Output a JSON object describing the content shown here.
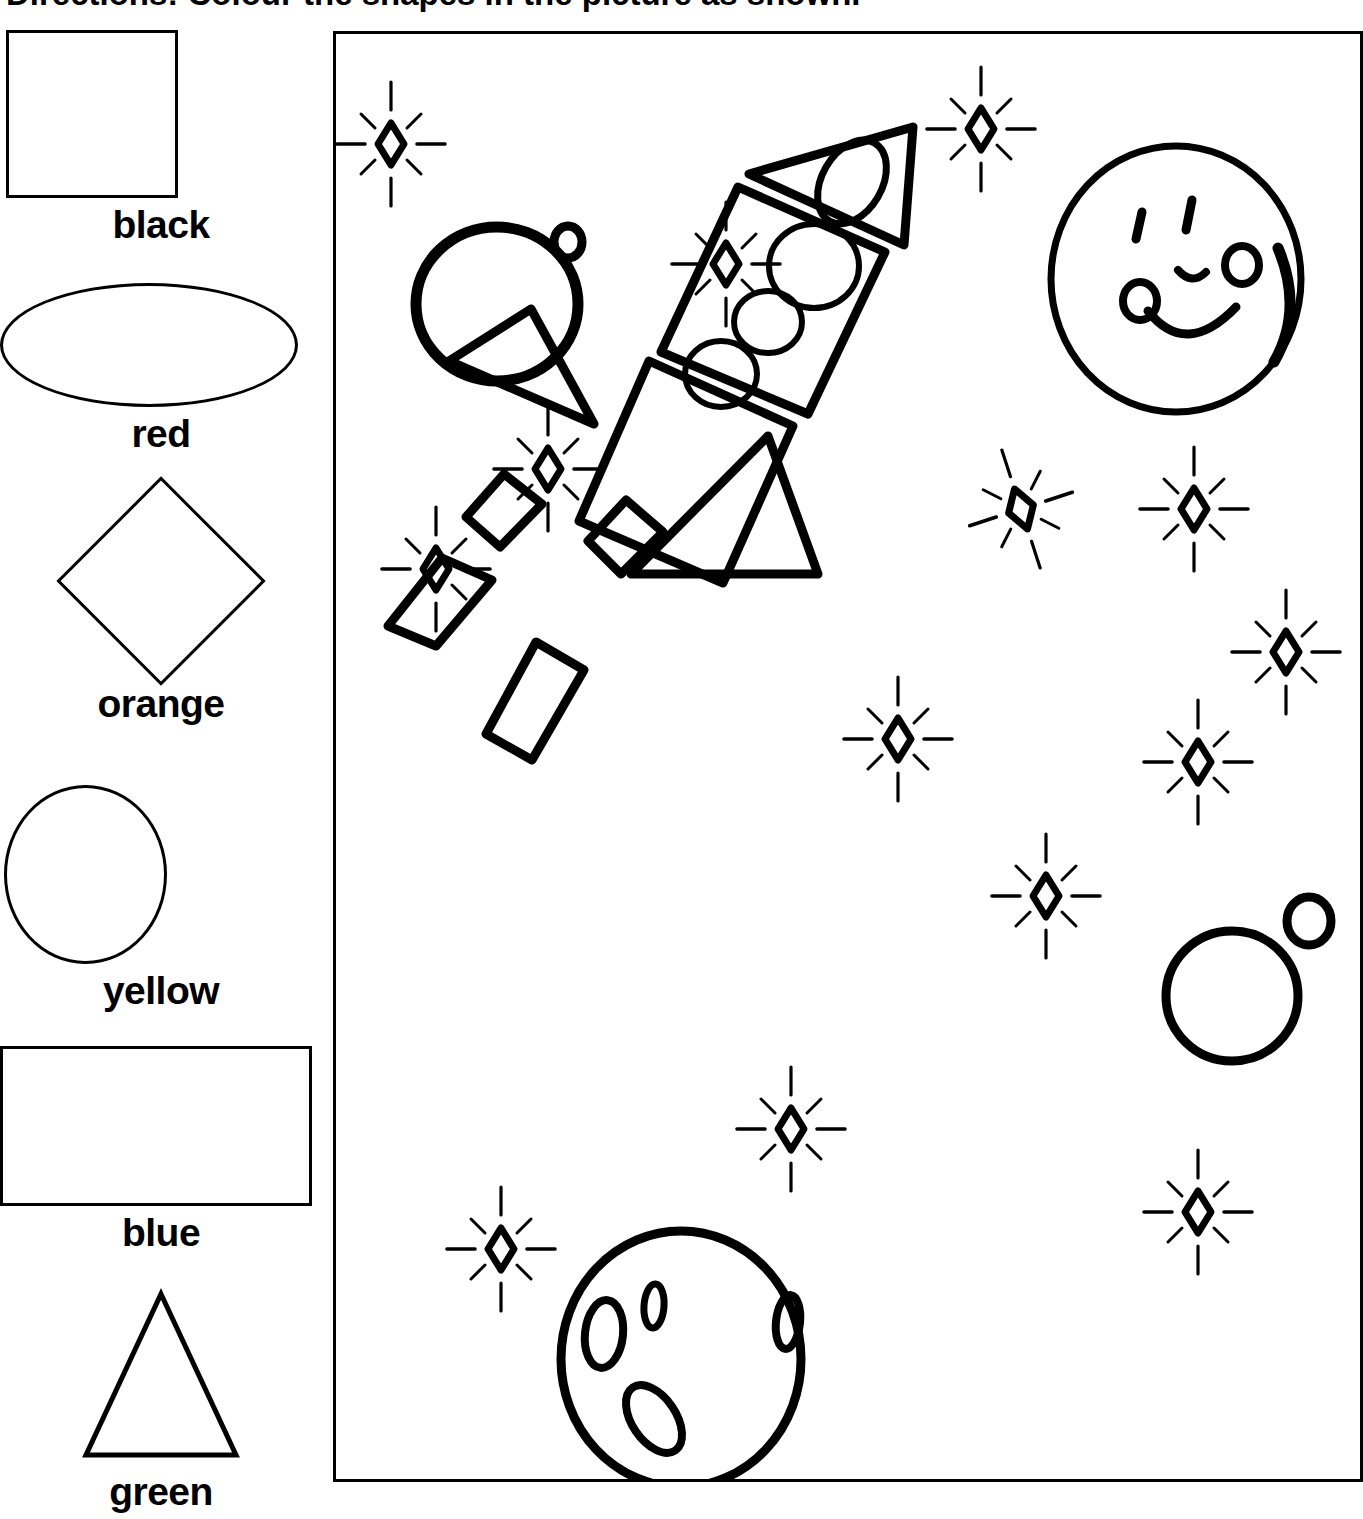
{
  "worksheet": {
    "title_lead": "Directions:",
    "title_rest": " Colour the shapes in the picture as shown.",
    "title_full": "Directions: Colour the shapes in the picture as shown.",
    "ink_color": "#000000",
    "page_background": "#ffffff"
  },
  "legend": {
    "heading": "Colour key",
    "items": [
      {
        "shape": "square",
        "label": "black",
        "shape_name": "square-swatch"
      },
      {
        "shape": "ellipse",
        "label": "red",
        "shape_name": "oval-swatch"
      },
      {
        "shape": "diamond",
        "label": "orange",
        "shape_name": "diamond-swatch"
      },
      {
        "shape": "circle",
        "label": "yellow",
        "shape_name": "circle-swatch"
      },
      {
        "shape": "rectangle",
        "label": "blue",
        "shape_name": "rectangle-swatch"
      },
      {
        "shape": "triangle",
        "label": "green",
        "shape_name": "triangle-swatch"
      }
    ]
  },
  "picture": {
    "caption": "Rocket in space colouring picture",
    "objects": [
      {
        "name": "planet-top-left",
        "type": "circle-pair",
        "detail": "large circle with small circle at upper right"
      },
      {
        "name": "smiling-planet",
        "type": "face-circle",
        "detail": "large circle with two eyes, nose and smile with round ends plus crescent arc"
      },
      {
        "name": "rocket",
        "type": "rocket",
        "detail": "triangle nose cone with oval window, rectangle body with three circles, square lower body, two triangle fins, four flame shapes"
      },
      {
        "name": "cratered-moon",
        "type": "moon",
        "detail": "circle with four oval craters"
      },
      {
        "name": "planet-bottom-right",
        "type": "circle-pair",
        "detail": "large circle with small circle at upper right"
      }
    ],
    "star_count": 16,
    "star_shape": "diamond with eight radiating rays"
  }
}
